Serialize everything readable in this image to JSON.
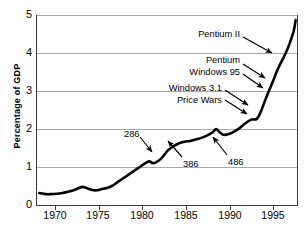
{
  "chart_data": {
    "type": "line",
    "title": "",
    "xlabel": "",
    "ylabel": "Percentage of GDP",
    "xlim": [
      1969,
      1997.2
    ],
    "ylim": [
      0,
      5
    ],
    "xticks": [
      1970,
      1975,
      1980,
      1985,
      1990,
      1995
    ],
    "xtick_labels": [
      "1970",
      "1975",
      "1980",
      "1985",
      "1990",
      "1995"
    ],
    "yticks": [
      0,
      1,
      2,
      3,
      4,
      5
    ],
    "ytick_labels": [
      "0",
      "1",
      "2",
      "3",
      "4",
      "5"
    ],
    "grid": "horizontal",
    "legend": "none",
    "line_color": "#000000",
    "grid_color": "#a8a8a8",
    "series": [
      {
        "name": "IT spending as percentage of GDP",
        "x": [
          1969.3,
          1970.0,
          1970.6,
          1971.2,
          1971.8,
          1972.4,
          1973.0,
          1973.6,
          1974.0,
          1974.4,
          1975.0,
          1975.5,
          1976.0,
          1976.6,
          1977.2,
          1977.8,
          1978.4,
          1979.0,
          1979.6,
          1980.2,
          1980.8,
          1981.2,
          1981.6,
          1982.0,
          1982.4,
          1982.8,
          1983.2,
          1983.8,
          1984.4,
          1985.0,
          1985.6,
          1986.2,
          1986.8,
          1987.4,
          1988.0,
          1988.4,
          1988.8,
          1989.2,
          1989.8,
          1990.4,
          1991.0,
          1991.6,
          1992.2,
          1992.8,
          1993.2,
          1993.6,
          1994.0,
          1994.6,
          1995.0,
          1995.6,
          1996.0,
          1996.4,
          1996.8,
          1997.0
        ],
        "y": [
          0.33,
          0.3,
          0.3,
          0.31,
          0.33,
          0.36,
          0.4,
          0.46,
          0.49,
          0.46,
          0.41,
          0.4,
          0.43,
          0.46,
          0.52,
          0.62,
          0.72,
          0.82,
          0.92,
          1.02,
          1.12,
          1.16,
          1.11,
          1.15,
          1.22,
          1.33,
          1.45,
          1.56,
          1.64,
          1.68,
          1.7,
          1.74,
          1.78,
          1.84,
          1.92,
          2.01,
          1.93,
          1.86,
          1.88,
          1.95,
          2.05,
          2.17,
          2.26,
          2.28,
          2.45,
          2.7,
          2.95,
          3.3,
          3.55,
          3.85,
          4.05,
          4.3,
          4.6,
          4.88
        ]
      }
    ],
    "annotations": [
      {
        "label": "Pentium II",
        "x": 1993.9,
        "y": 4.05,
        "align": "right"
      },
      {
        "label": "Pentium",
        "x": 1992.6,
        "y": 3.42,
        "align": "right"
      },
      {
        "label": "Windows 95",
        "x": 1992.6,
        "y": 3.15,
        "align": "right"
      },
      {
        "label": "Windows 3.1",
        "x": 1991.3,
        "y": 2.82,
        "align": "right"
      },
      {
        "label": "Price Wars",
        "x": 1991.3,
        "y": 2.58,
        "align": "right"
      },
      {
        "label": "286",
        "x": 1981.3,
        "y": 1.74,
        "align": "center"
      },
      {
        "label": "386",
        "x": 1986.8,
        "y": 1.14,
        "align": "center"
      },
      {
        "label": "486",
        "x": 1991.0,
        "y": 1.16,
        "align": "center"
      }
    ]
  },
  "axis": {
    "y_title": "Percentage of GDP",
    "y_labels": [
      "5",
      "4",
      "3",
      "2",
      "1",
      "0"
    ],
    "x_labels": [
      "1970",
      "1975",
      "1980",
      "1985",
      "1990",
      "1995"
    ]
  },
  "annotations": {
    "pentium2": "Pentium II",
    "pentium": "Pentium",
    "windows95": "Windows 95",
    "windows31": "Windows 3.1",
    "pricewars": "Price Wars",
    "cpu286": "286",
    "cpu386": "386",
    "cpu486": "486"
  },
  "footer": {
    "source_partial": ""
  }
}
